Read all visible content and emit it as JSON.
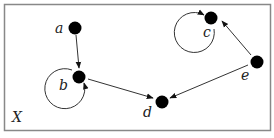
{
  "diagram": {
    "set_label": "X",
    "colors": {
      "frame": "#888888",
      "node": "#000000",
      "edge": "#333333",
      "background": "#ffffff"
    },
    "nodes": [
      {
        "id": "a",
        "label": "a",
        "x": 75,
        "y": 28
      },
      {
        "id": "b",
        "label": "b",
        "x": 79,
        "y": 77
      },
      {
        "id": "c",
        "label": "c",
        "x": 211,
        "y": 18
      },
      {
        "id": "d",
        "label": "d",
        "x": 162,
        "y": 102
      },
      {
        "id": "e",
        "label": "e",
        "x": 257,
        "y": 62
      }
    ],
    "edges": [
      {
        "from": "a",
        "to": "b"
      },
      {
        "from": "b",
        "to": "d"
      },
      {
        "from": "e",
        "to": "d"
      },
      {
        "from": "e",
        "to": "c"
      },
      {
        "from": "b",
        "to": "b",
        "type": "self-loop"
      },
      {
        "from": "c",
        "to": "c",
        "type": "self-loop"
      }
    ]
  }
}
